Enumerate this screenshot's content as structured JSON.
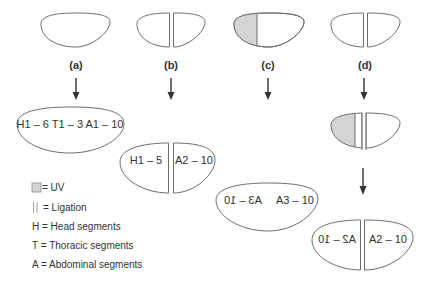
{
  "colors": {
    "outline": "#6e6e6e",
    "uv_fill": "#d4d4d4",
    "text": "#333333",
    "background": "#ffffff"
  },
  "panels": [
    {
      "id": "a",
      "label": "(a)",
      "treatment": "none",
      "result": [
        "H1 – 6 T1 – 3 A1 – 10"
      ]
    },
    {
      "id": "b",
      "label": "(b)",
      "treatment": "ligation",
      "result": [
        "H1 – 5",
        "A2 – 10"
      ]
    },
    {
      "id": "c",
      "label": "(c)",
      "treatment": "UV anterior",
      "result": [
        "A3 – 10 (mirrored)",
        "A3 – 10"
      ]
    },
    {
      "id": "d",
      "label": "(d)",
      "treatment": "UV anterior + ligation",
      "result": [
        "A2 – 10 (mirrored)",
        "A2 – 10"
      ]
    }
  ],
  "results": {
    "a": {
      "text": "H1 – 6 T1 – 3 A1 – 10"
    },
    "b": {
      "left": "H1 – 5",
      "right": "A2 – 10"
    },
    "c": {
      "left_mirrored": "A3 – 10",
      "right": "A3 – 10"
    },
    "d": {
      "left_mirrored": "A2 – 10",
      "right": "A2 – 10"
    }
  },
  "legend": {
    "uv": "= UV",
    "ligation": "=  Ligation",
    "head": "H = Head segments",
    "thoracic": "T  = Thoracic segments",
    "abdominal": "A  = Abdominal segments"
  }
}
